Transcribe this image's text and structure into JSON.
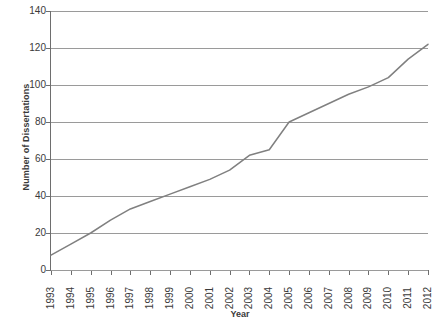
{
  "chart_data": {
    "type": "line",
    "title": "",
    "xlabel": "Year",
    "ylabel": "Number of Dissertations",
    "categories": [
      "1993",
      "1994",
      "1995",
      "1996",
      "1997",
      "1998",
      "1999",
      "2000",
      "2001",
      "2002",
      "2003",
      "2004",
      "2005",
      "2006",
      "2007",
      "2008",
      "2009",
      "2010",
      "2011",
      "2012"
    ],
    "values": [
      8,
      14,
      20,
      27,
      33,
      37,
      41,
      45,
      49,
      54,
      62,
      65,
      80,
      85,
      90,
      95,
      99,
      104,
      114,
      122
    ],
    "x": [
      1993,
      1994,
      1995,
      1996,
      1997,
      1998,
      1999,
      2000,
      2001,
      2002,
      2003,
      2004,
      2005,
      2006,
      2007,
      2008,
      2009,
      2010,
      2011,
      2012
    ],
    "ylim": [
      0,
      140
    ],
    "xlim": [
      1993,
      2012
    ],
    "yticks": [
      0,
      20,
      40,
      60,
      80,
      100,
      120,
      140
    ],
    "ytick_labels": [
      "0",
      "20",
      "40",
      "60",
      "80",
      "100",
      "120",
      "140"
    ],
    "grid": "horizontal",
    "legend": "none",
    "series": [
      {
        "name": "Number of Dissertations",
        "color": "#808080",
        "values": [
          8,
          14,
          20,
          27,
          33,
          37,
          41,
          45,
          49,
          54,
          62,
          65,
          80,
          85,
          90,
          95,
          99,
          104,
          114,
          122
        ]
      }
    ],
    "colors": {
      "line": "#808080",
      "grid": "#9a9a9a",
      "axis": "#6e6e6e",
      "text": "#3a3a3a",
      "background": "#ffffff"
    }
  }
}
